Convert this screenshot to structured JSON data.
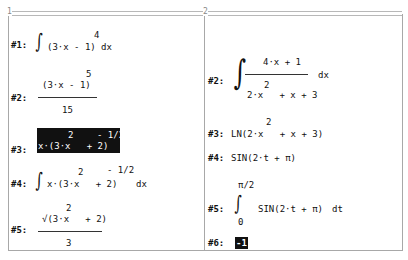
{
  "windows": [
    {
      "number": "1",
      "expressions": [
        {
          "label": "#1:",
          "integrand": "(3·x - 1)",
          "exponent": "4",
          "differential": "dx"
        },
        {
          "label": "#2:",
          "numerator": "(3·x - 1)",
          "numerator_exponent": "5",
          "denominator": "15"
        },
        {
          "label": "#3:",
          "base": "x·(3·x   + 2)",
          "inner_exponent": "2",
          "outer_exponent": "- 1/2",
          "highlighted": true
        },
        {
          "label": "#4:",
          "integrand": "x·(3·x   + 2)",
          "inner_exponent": "2",
          "outer_exponent": "- 1/2",
          "differential": "dx"
        },
        {
          "label": "#5:",
          "numerator": "√(3·x   + 2)",
          "inner_exponent": "2",
          "denominator": "3"
        }
      ]
    },
    {
      "number": "2",
      "expressions": [
        {
          "label": "#2:",
          "numerator": "4·x + 1",
          "denominator": "2·x   + x + 3",
          "denominator_exponent": "2",
          "differential": "dx"
        },
        {
          "label": "#3:",
          "text": "LN(2·x   + x + 3)",
          "exponent": "2"
        },
        {
          "label": "#4:",
          "text": "SIN(2·t + π)"
        },
        {
          "label": "#5:",
          "upper_limit": "π/2",
          "lower_limit": "0",
          "integrand": "SIN(2·t + π)",
          "differential": "dt"
        },
        {
          "label": "#6:",
          "result": "-1",
          "cursor": true
        }
      ]
    }
  ]
}
